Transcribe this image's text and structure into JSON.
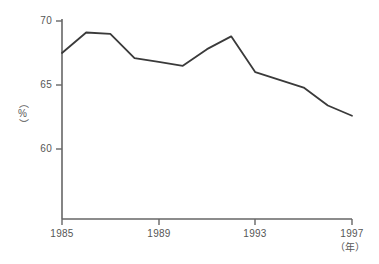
{
  "chart_data": {
    "type": "line",
    "title": "",
    "xlabel": "（年）",
    "ylabel": "（%）",
    "x": [
      1985,
      1986,
      1987,
      1988,
      1989,
      1990,
      1991,
      1992,
      1993,
      1994,
      1995,
      1996,
      1997
    ],
    "values": [
      67.5,
      69.1,
      69.0,
      67.1,
      66.8,
      66.5,
      67.8,
      68.8,
      66.0,
      65.4,
      64.8,
      63.4,
      62.6
    ],
    "series": [
      {
        "name": "",
        "values": [
          67.5,
          69.1,
          69.0,
          67.1,
          66.8,
          66.5,
          67.8,
          68.8,
          66.0,
          65.4,
          64.8,
          63.4,
          62.6
        ]
      }
    ],
    "xlim": [
      1985,
      1997
    ],
    "ylim": [
      57.0,
      70.0
    ],
    "xticks": [
      1985,
      1989,
      1993,
      1997
    ],
    "xtick_labels": [
      "1985",
      "1989",
      "1993",
      "1997"
    ],
    "yticks": [
      60,
      65,
      70
    ],
    "ytick_labels": [
      "60",
      "65",
      "70"
    ],
    "grid": false,
    "legend": null,
    "line_color": "#3a3a3a",
    "axis_color": "#666666",
    "background_color": "#ffffff"
  },
  "axes": {
    "y_title": "（%）",
    "x_title": "（年）",
    "y_ticks": [
      {
        "label": "70",
        "value": 70
      },
      {
        "label": "65",
        "value": 65
      },
      {
        "label": "60",
        "value": 60
      }
    ],
    "x_ticks": [
      {
        "label": "1985",
        "value": 1985
      },
      {
        "label": "1989",
        "value": 1989
      },
      {
        "label": "1993",
        "value": 1993
      },
      {
        "label": "1997",
        "value": 1997
      }
    ]
  }
}
